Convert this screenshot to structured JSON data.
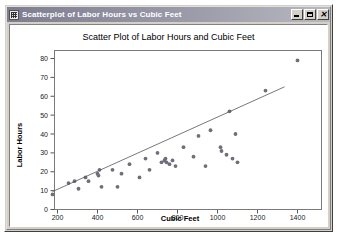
{
  "window": {
    "title": "Scatterplot of Labor Hours vs Cubic Feet",
    "icon": "grid-window-icon",
    "buttons": {
      "minimize": "_",
      "maximize": "□",
      "close": "✕"
    }
  },
  "chart_data": {
    "type": "scatter",
    "title": "Scatter Plot of Labor Hours and Cubic Feet",
    "xlabel": "Cubic Feet",
    "ylabel": "Labor Hours",
    "xlim": [
      140,
      1460
    ],
    "ylim": [
      -2,
      85
    ],
    "xticks": [
      200,
      400,
      600,
      800,
      1000,
      1200,
      1400
    ],
    "xtick_labels": [
      "200",
      "400",
      "600",
      "800",
      "1000",
      "1200",
      "1400"
    ],
    "yticks": [
      0,
      10,
      20,
      30,
      40,
      50,
      60,
      70,
      80
    ],
    "ytick_labels": [
      "0",
      "10",
      "20",
      "30",
      "40",
      "50",
      "60",
      "70",
      "80"
    ],
    "grid": false,
    "legend": null,
    "marker": "filled-circle",
    "marker_color": "#6f6f7a",
    "points": [
      {
        "x": 175,
        "y": 8
      },
      {
        "x": 255,
        "y": 14
      },
      {
        "x": 285,
        "y": 15
      },
      {
        "x": 305,
        "y": 11
      },
      {
        "x": 340,
        "y": 17
      },
      {
        "x": 355,
        "y": 15
      },
      {
        "x": 400,
        "y": 19
      },
      {
        "x": 405,
        "y": 18
      },
      {
        "x": 410,
        "y": 21
      },
      {
        "x": 420,
        "y": 12
      },
      {
        "x": 475,
        "y": 21
      },
      {
        "x": 500,
        "y": 12
      },
      {
        "x": 520,
        "y": 19
      },
      {
        "x": 560,
        "y": 24
      },
      {
        "x": 610,
        "y": 17
      },
      {
        "x": 640,
        "y": 27
      },
      {
        "x": 660,
        "y": 21
      },
      {
        "x": 700,
        "y": 30
      },
      {
        "x": 720,
        "y": 25
      },
      {
        "x": 735,
        "y": 26
      },
      {
        "x": 740,
        "y": 27
      },
      {
        "x": 745,
        "y": 25
      },
      {
        "x": 760,
        "y": 24
      },
      {
        "x": 775,
        "y": 26
      },
      {
        "x": 790,
        "y": 23
      },
      {
        "x": 830,
        "y": 33
      },
      {
        "x": 880,
        "y": 28
      },
      {
        "x": 905,
        "y": 39
      },
      {
        "x": 940,
        "y": 23
      },
      {
        "x": 965,
        "y": 42
      },
      {
        "x": 1015,
        "y": 33
      },
      {
        "x": 1020,
        "y": 31
      },
      {
        "x": 1045,
        "y": 29
      },
      {
        "x": 1060,
        "y": 52
      },
      {
        "x": 1075,
        "y": 27
      },
      {
        "x": 1090,
        "y": 40
      },
      {
        "x": 1100,
        "y": 25
      },
      {
        "x": 1240,
        "y": 63
      },
      {
        "x": 1400,
        "y": 79
      }
    ],
    "fit_line": {
      "label": "least-squares fit",
      "x_start": 175,
      "y_start": 9.5,
      "x_end": 1335,
      "y_end": 65.0
    }
  }
}
